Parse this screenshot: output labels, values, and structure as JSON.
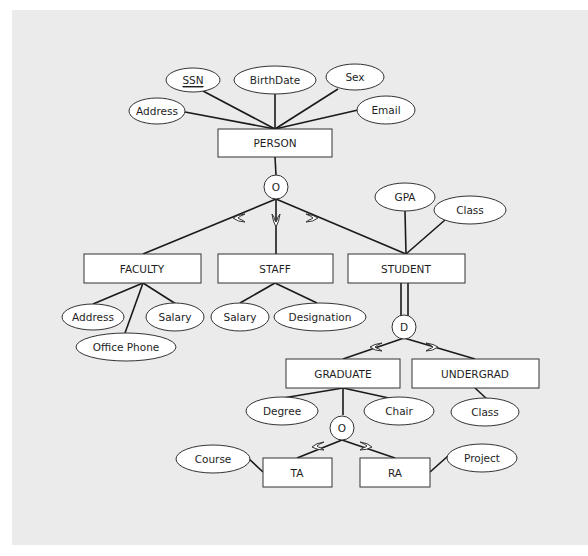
{
  "diagram": {
    "type": "EER diagram",
    "colors": {
      "background": "#ffffff",
      "panel": "#ebebeb",
      "stroke": "#333333",
      "fill": "#ffffff"
    },
    "entities": {
      "person": "PERSON",
      "faculty": "FACULTY",
      "staff": "STAFF",
      "student": "STUDENT",
      "graduate": "GRADUATE",
      "undergrad": "UNDERGRAD",
      "ta": "TA",
      "ra": "RA"
    },
    "attributes": {
      "person_ssn": "SSN",
      "person_birthdate": "BirthDate",
      "person_sex": "Sex",
      "person_address": "Address",
      "person_email": "Email",
      "faculty_address": "Address",
      "faculty_salary": "Salary",
      "faculty_office_phone": "Office Phone",
      "staff_salary": "Salary",
      "staff_designation": "Designation",
      "student_gpa": "GPA",
      "student_class": "Class",
      "graduate_degree": "Degree",
      "graduate_chair": "Chair",
      "undergrad_class": "Class",
      "ta_course": "Course",
      "ra_project": "Project"
    },
    "specializations": {
      "person_spec": "O",
      "student_spec": "D",
      "graduate_spec": "O"
    },
    "key_attribute": "SSN",
    "total_participation": "STUDENT → D (double line)"
  }
}
